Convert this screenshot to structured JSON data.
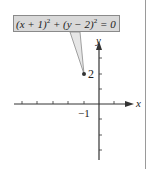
{
  "figure": {
    "equation": {
      "lhs_part1": "(x + 1)",
      "exp1": "2",
      "plus": " + ",
      "lhs_part2": "(y − 2)",
      "exp2": "2",
      "rhs": " = 0"
    },
    "axes": {
      "x_label": "x",
      "y_label": "y",
      "x_tick_label": "−1",
      "y_tick_label": "2"
    },
    "point": {
      "x": -1,
      "y": 2
    },
    "colors": {
      "callout_fill": "#d9d9d9",
      "callout_border": "#8a8a8a",
      "axis": "#333333",
      "point": "#333333"
    }
  }
}
